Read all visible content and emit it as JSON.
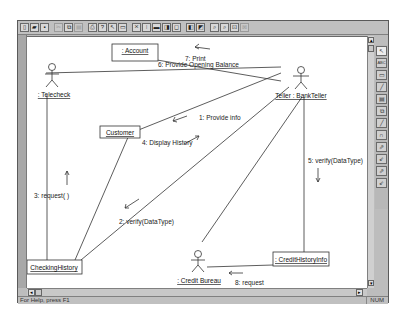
{
  "toolbar": {
    "buttons": [
      {
        "name": "new-file-icon",
        "glyph": "▯"
      },
      {
        "name": "open-file-icon",
        "glyph": "▰"
      },
      {
        "name": "save-icon",
        "glyph": "▪"
      },
      {
        "name": "cut-icon",
        "glyph": "✂",
        "disabled": true
      },
      {
        "name": "copy-icon",
        "glyph": "⧉"
      },
      {
        "name": "paste-icon",
        "glyph": "▤",
        "disabled": true
      },
      {
        "name": "print-icon",
        "glyph": "⎙"
      },
      {
        "name": "help-icon",
        "glyph": "?"
      },
      {
        "name": "context-help-icon",
        "glyph": "↖"
      },
      {
        "name": "browse-icon",
        "glyph": "▭"
      },
      {
        "name": "class-diagram-icon",
        "glyph": "⨯"
      },
      {
        "name": "sequence-icon",
        "glyph": "⁞"
      },
      {
        "name": "collaboration-icon",
        "glyph": "▬"
      },
      {
        "name": "component-icon",
        "glyph": "◨"
      },
      {
        "name": "deployment-icon",
        "glyph": "◻"
      },
      {
        "name": "prev-diagram-icon",
        "glyph": "◧"
      },
      {
        "name": "next-diagram-icon",
        "glyph": "◩"
      },
      {
        "name": "zoom-in-icon",
        "glyph": "⌕"
      },
      {
        "name": "zoom-out-icon",
        "glyph": "⌕"
      },
      {
        "name": "fit-window-icon",
        "glyph": "⊡"
      },
      {
        "name": "undo-fit-icon",
        "glyph": "⊠",
        "disabled": true
      }
    ]
  },
  "palette": {
    "tools": [
      {
        "name": "selection-tool-icon",
        "glyph": "↖"
      },
      {
        "name": "text-tool-icon",
        "glyph": "ABC"
      },
      {
        "name": "note-tool-icon",
        "glyph": "▭"
      },
      {
        "name": "anchor-note-tool-icon",
        "glyph": "╱"
      },
      {
        "name": "object-tool-icon",
        "glyph": "▤"
      },
      {
        "name": "class-instance-tool-icon",
        "glyph": "⧉"
      },
      {
        "name": "object-link-tool-icon",
        "glyph": "╱"
      },
      {
        "name": "link-to-self-tool-icon",
        "glyph": "∩"
      },
      {
        "name": "link-message-tool-icon",
        "glyph": "⇗"
      },
      {
        "name": "reverse-link-message-tool-icon",
        "glyph": "⇙"
      },
      {
        "name": "data-flow-tool-icon",
        "glyph": "⇗"
      },
      {
        "name": "reverse-data-flow-tool-icon",
        "glyph": "⇙"
      }
    ]
  },
  "diagram": {
    "objects": {
      "account": ": Account",
      "customer": "Customer",
      "checking_history": "CheckingHistory",
      "credit_history_info": ": CreditHistoryInfo"
    },
    "actors": {
      "telecheck": ": Telecheck",
      "teller": "Teller : BankTeller",
      "credit_bureau": ": Credit Bureau"
    },
    "messages": {
      "m1": "1: Provide info",
      "m2": "2: verify(DataType)",
      "m3": "3: request( )",
      "m4": "4: Display History",
      "m5": "5: verify(DataType)",
      "m6": "6: Provide Opening Balance",
      "m7": "7: Print",
      "m8": "8: request"
    }
  },
  "status": {
    "help_text": "For Help, press F1",
    "indicator": "NUM"
  }
}
